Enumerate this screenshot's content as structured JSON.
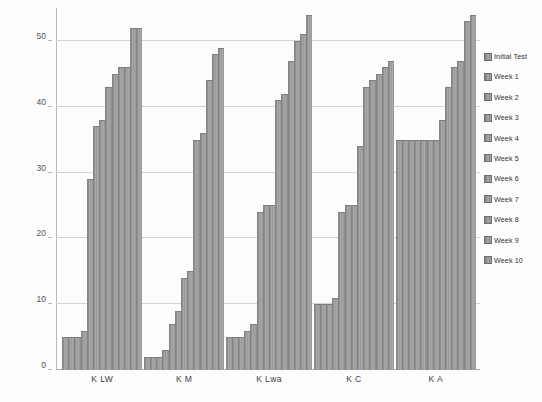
{
  "chart_data": {
    "type": "bar",
    "title": "",
    "subtitle": "",
    "xlabel": "",
    "ylabel": "",
    "ylim": [
      0,
      55
    ],
    "yticks": [
      0,
      10,
      20,
      30,
      40,
      50
    ],
    "grid": true,
    "legend_position": "right",
    "categories": [
      "K LW",
      "K M",
      "K Lwa",
      "K C",
      "K A"
    ],
    "series": [
      {
        "name": "Initial Test",
        "values": [
          5,
          2,
          5,
          10,
          35
        ]
      },
      {
        "name": "Week 1",
        "values": [
          5,
          2,
          5,
          10,
          35
        ]
      },
      {
        "name": "Week 2",
        "values": [
          5,
          2,
          5,
          10,
          35
        ]
      },
      {
        "name": "Week 3",
        "values": [
          6,
          3,
          6,
          11,
          35
        ]
      },
      {
        "name": "Week 4",
        "values": [
          29,
          7,
          7,
          24,
          35
        ]
      },
      {
        "name": "Week 5",
        "values": [
          37,
          9,
          24,
          25,
          35
        ]
      },
      {
        "name": "Week 6",
        "values": [
          38,
          14,
          25,
          25,
          35
        ]
      },
      {
        "name": "Week 7",
        "values": [
          43,
          15,
          25,
          34,
          38
        ]
      },
      {
        "name": "Week 8",
        "values": [
          45,
          35,
          41,
          43,
          43
        ]
      },
      {
        "name": "Week 9",
        "values": [
          46,
          36,
          42,
          44,
          46
        ]
      },
      {
        "name": "Week 10",
        "values": [
          46,
          44,
          47,
          45,
          47
        ]
      }
    ],
    "extra_series_note": "",
    "tall_bars": {
      "K LW": [
        52,
        52
      ],
      "K M": [
        48,
        49
      ],
      "K Lwa": [
        50,
        51,
        54
      ],
      "K C": [
        46,
        47
      ],
      "K A": [
        53,
        54
      ]
    }
  },
  "legend": {
    "items": [
      {
        "label": "Initial Test"
      },
      {
        "label": "Week 1"
      },
      {
        "label": "Week 2"
      },
      {
        "label": "Week 3"
      },
      {
        "label": "Week 4"
      },
      {
        "label": "Week 5"
      },
      {
        "label": "Week 6"
      },
      {
        "label": "Week 7"
      },
      {
        "label": "Week 8"
      },
      {
        "label": "Week 9"
      },
      {
        "label": "Week 10"
      }
    ]
  },
  "axis": {
    "y_ticks": [
      "0",
      "10",
      "20",
      "30",
      "40",
      "50"
    ],
    "x_categories": [
      "K LW",
      "K M",
      "K Lwa",
      "K C",
      "K A"
    ]
  },
  "colors": {
    "bar_fill": "#9a9a9a",
    "bar_stroke": "#7e7e7e",
    "gridline": "#d4d4d4",
    "axis": "#b0b0b0",
    "text": "#3a3a3a",
    "background": "#fdfdfd"
  }
}
